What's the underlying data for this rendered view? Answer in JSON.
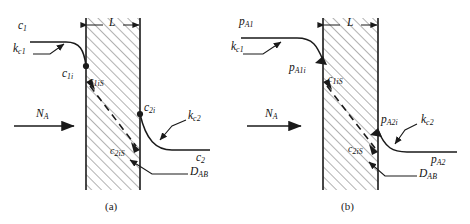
{
  "figure": {
    "type": "mass-transfer-slab-diagram",
    "ink_color": "#1a1a1a",
    "hatch_color": "#555555",
    "background": "#ffffff"
  },
  "panels": [
    {
      "id": "a",
      "caption": "(a)",
      "driving_force": "concentration",
      "slab": {
        "thickness_label": "L",
        "hatching": "45-degree",
        "diffusivity_label": "D",
        "diffusivity_sub": "AB"
      },
      "flux": {
        "label": "N",
        "sub": "A"
      },
      "labels": [
        {
          "name": "bulk-left",
          "main": "c",
          "sub": "1"
        },
        {
          "name": "coef-left",
          "main": "k",
          "sub": "c1"
        },
        {
          "name": "interface-left",
          "main": "c",
          "sub": "1i"
        },
        {
          "name": "surface-left",
          "main": "c",
          "sub": "1iS"
        },
        {
          "name": "surface-right",
          "main": "c",
          "sub": "2iS"
        },
        {
          "name": "interface-right",
          "main": "c",
          "sub": "2i"
        },
        {
          "name": "coef-right",
          "main": "k",
          "sub": "c2"
        },
        {
          "name": "bulk-right",
          "main": "c",
          "sub": "2"
        },
        {
          "name": "diffusivity",
          "main": "D",
          "sub": "AB"
        }
      ]
    },
    {
      "id": "b",
      "caption": "(b)",
      "driving_force": "partial-pressure",
      "slab": {
        "thickness_label": "L",
        "hatching": "45-degree",
        "diffusivity_label": "D",
        "diffusivity_sub": "AB"
      },
      "flux": {
        "label": "N",
        "sub": "A"
      },
      "labels": [
        {
          "name": "bulk-left",
          "main": "p",
          "sub": "A1"
        },
        {
          "name": "coef-left",
          "main": "k",
          "sub": "c1"
        },
        {
          "name": "interface-left",
          "main": "p",
          "sub": "A1i"
        },
        {
          "name": "surface-left",
          "main": "c",
          "sub": "1iS"
        },
        {
          "name": "surface-right",
          "main": "c",
          "sub": "2iS"
        },
        {
          "name": "interface-right",
          "main": "p",
          "sub": "A2i"
        },
        {
          "name": "coef-right",
          "main": "k",
          "sub": "c2"
        },
        {
          "name": "bulk-right",
          "main": "p",
          "sub": "A2"
        },
        {
          "name": "diffusivity",
          "main": "D",
          "sub": "AB"
        }
      ]
    }
  ]
}
